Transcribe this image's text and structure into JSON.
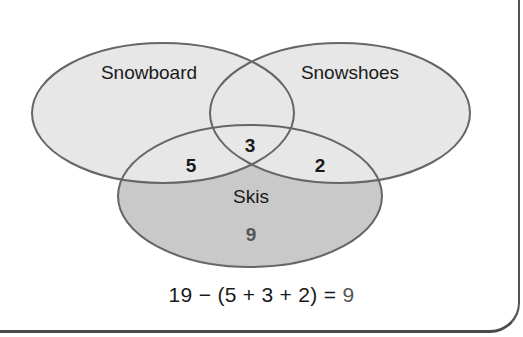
{
  "diagram": {
    "type": "venn",
    "sets": [
      {
        "name": "Snowboard",
        "fill": "#e6e6e6"
      },
      {
        "name": "Snowshoes",
        "fill": "#e6e6e6"
      },
      {
        "name": "Skis",
        "fill": "#c8c8c8"
      }
    ],
    "regions": {
      "snowboard_skis": "5",
      "all_three": "3",
      "snowshoes_skis": "2",
      "skis_only": "9"
    },
    "equation": {
      "lhs": "19 − (5 + 3 + 2) =",
      "result": "9"
    },
    "colors": {
      "outline": "#666666",
      "light_fill": "#e6e6e6",
      "dark_fill": "#c8c8c8",
      "text": "#1a1a1a",
      "result_text": "#555555"
    }
  }
}
